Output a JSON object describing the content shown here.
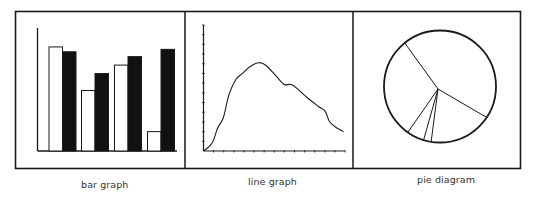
{
  "panels": [
    {
      "id": "bar",
      "label": "bar graph"
    },
    {
      "id": "line",
      "label": "line graph"
    },
    {
      "id": "pie",
      "label": "pie diagram"
    }
  ],
  "colors": {
    "ink": "#1a1a1a",
    "background": "#ffffff",
    "label": "#333333"
  },
  "chart_data": [
    {
      "type": "bar",
      "title": "bar graph",
      "xlabel": "",
      "ylabel": "",
      "categories": [
        "1",
        "2",
        "3",
        "4"
      ],
      "series": [
        {
          "name": "white",
          "fill": "#ffffff",
          "values": [
            86,
            50,
            71,
            16
          ]
        },
        {
          "name": "black",
          "fill": "#111111",
          "values": [
            82,
            64,
            78,
            84
          ]
        }
      ],
      "ylim": [
        0,
        100
      ],
      "grid": false,
      "legend": null
    },
    {
      "type": "line",
      "title": "line graph",
      "xlabel": "",
      "ylabel": "",
      "x": [
        0,
        6,
        10,
        14,
        18,
        23,
        28,
        33,
        39,
        44,
        51,
        57,
        62,
        67,
        74,
        81,
        86,
        89,
        93,
        99
      ],
      "values": [
        0,
        6,
        18,
        26,
        44,
        56,
        61,
        66,
        69,
        67,
        59,
        52,
        52,
        48,
        41,
        35,
        31,
        23,
        19,
        15
      ],
      "xlim": [
        0,
        100
      ],
      "ylim": [
        0,
        100
      ],
      "x_ticks": 14,
      "y_ticks": 13,
      "grid": false
    },
    {
      "type": "pie",
      "title": "pie diagram",
      "slices": [
        {
          "label": "A",
          "value": 45.1
        },
        {
          "label": "B",
          "value": 18.2
        },
        {
          "label": "C",
          "value": 2.2
        },
        {
          "label": "D",
          "value": 5.0
        },
        {
          "label": "E",
          "value": 29.4
        }
      ],
      "start_angle_deg": 231,
      "legend": null
    }
  ]
}
